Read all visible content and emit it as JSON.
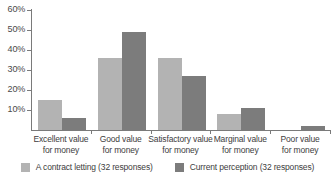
{
  "chart_data": {
    "type": "bar",
    "title": "",
    "xlabel": "",
    "ylabel": "",
    "ylim": [
      0,
      60
    ],
    "y_unit": "%",
    "grid": false,
    "legend_position": "bottom",
    "categories": [
      "Excellent value for money",
      "Good value for money",
      "Satisfactory value for money",
      "Marginal value for money",
      "Poor value for money"
    ],
    "category_lines": [
      [
        "Excellent value",
        "for money"
      ],
      [
        "Good value",
        "for money"
      ],
      [
        "Satisfactory value",
        "for money"
      ],
      [
        "Marginal value",
        "for money"
      ],
      [
        "Poor value",
        "for money"
      ]
    ],
    "ticks": [
      "10%",
      "20%",
      "30%",
      "40%",
      "50%",
      "60%"
    ],
    "tick_values": [
      10,
      20,
      30,
      40,
      50,
      60
    ],
    "series": [
      {
        "name": "A contract letting (32 responses)",
        "color": "#b3b3b3",
        "values": [
          15,
          36,
          36,
          8,
          0
        ]
      },
      {
        "name": "Current perception (32 responses)",
        "color": "#7c7c7c",
        "values": [
          6,
          49,
          27,
          11,
          2
        ]
      }
    ]
  },
  "axis": {
    "line_color": "#7a7a7a"
  }
}
